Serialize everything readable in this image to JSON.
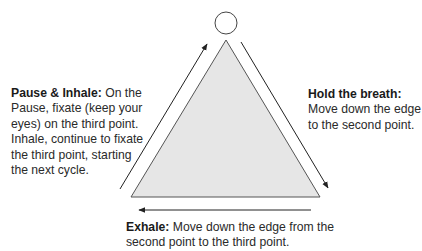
{
  "diagram": {
    "title_cut_off": "",
    "colors": {
      "triangle_fill": "#e6e6e6",
      "stroke": "#333333",
      "background": "#ffffff"
    },
    "shapes": {
      "circle": {
        "cx": 226,
        "cy": 23,
        "r": 11
      },
      "triangle": {
        "points": [
          [
            226,
            40
          ],
          [
            131,
            197
          ],
          [
            320,
            197
          ]
        ]
      },
      "arrows": [
        {
          "name": "inhale-arrow",
          "from": [
            120,
            189
          ],
          "to": [
            207,
            44
          ],
          "head": "end"
        },
        {
          "name": "hold-arrow",
          "from": [
            241,
            42
          ],
          "to": [
            328,
            188
          ],
          "head": "end"
        },
        {
          "name": "exhale-arrow",
          "from": [
            311,
            210
          ],
          "to": [
            139,
            210
          ],
          "head": "end"
        }
      ]
    },
    "labels": {
      "left": {
        "heading": "Pause & Inhale:",
        "text_line1": " On the",
        "text_rest": "Pause, fixate (keep your eyes) on the third  point. Inhale, continue to fixate the third point, starting the next cycle."
      },
      "right": {
        "heading": "Hold the breath:",
        "text": "Move down the edge to the second point."
      },
      "bottom": {
        "heading": "Exhale:",
        "text": " Move down the edge from the second point to the third point."
      }
    }
  }
}
